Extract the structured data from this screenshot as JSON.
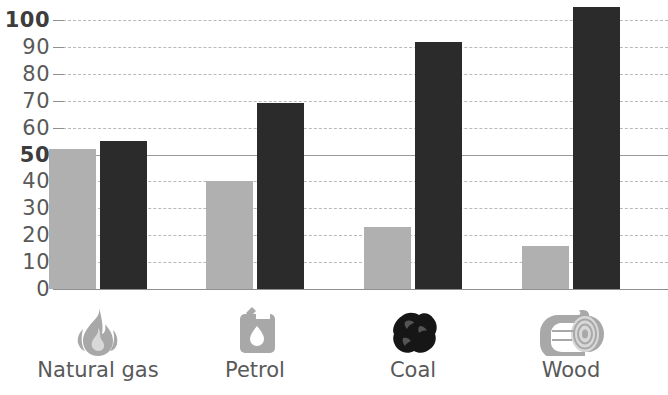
{
  "chart_data": {
    "type": "bar",
    "title": "",
    "xlabel": "",
    "ylabel": "",
    "ylim": [
      0,
      100
    ],
    "grid": true,
    "legend": "none",
    "categories": [
      "Natural gas",
      "Petrol",
      "Coal",
      "Wood"
    ],
    "ytick_labels": [
      "0",
      "10",
      "20",
      "30",
      "40",
      "50",
      "60",
      "70",
      "80",
      "90",
      "100"
    ],
    "ytick_values": [
      0,
      10,
      20,
      30,
      40,
      50,
      60,
      70,
      80,
      90,
      100
    ],
    "emphasized_yticks": [
      "50",
      "100"
    ],
    "series": [
      {
        "name": "light",
        "color": "#b0b0b0",
        "values": [
          52,
          40,
          23,
          16
        ]
      },
      {
        "name": "dark",
        "color": "#2b2b2b",
        "values": [
          55,
          69,
          92,
          105
        ]
      }
    ],
    "category_icons": [
      "flame-icon",
      "jerrycan-icon",
      "coal-icon",
      "log-icon"
    ]
  },
  "colors": {
    "light_bar": "#b0b0b0",
    "dark_bar": "#2b2b2b",
    "text": "#595959",
    "gridline": "#b9b9b9",
    "axis": "#8f8f8f",
    "coal_icon": "#161616",
    "icon_gray": "#a8a8a8"
  }
}
